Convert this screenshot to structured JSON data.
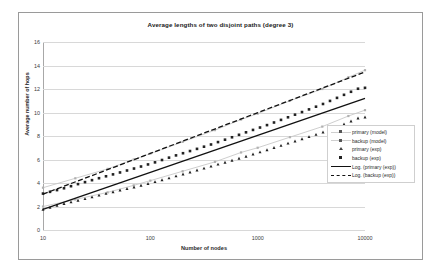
{
  "chart_data": {
    "type": "line",
    "title": "Average lengths of two disjoint paths (degree 3)",
    "xlabel": "Number of nodes",
    "ylabel": "Average number of hops",
    "xscale": "log",
    "xlim": [
      10,
      10000
    ],
    "ylim": [
      0,
      16
    ],
    "ytick_labels": [
      "0",
      "2",
      "4",
      "6",
      "8",
      "10",
      "12",
      "14",
      "16"
    ],
    "yticks": [
      0,
      2,
      4,
      6,
      8,
      10,
      12,
      14,
      16
    ],
    "xtick_labels": [
      "10",
      "100",
      "1000",
      "10000"
    ],
    "xticks": [
      10,
      100,
      1000,
      10000
    ],
    "grid": "horizontal",
    "legend_position": "right-middle",
    "legend": [
      "primary (model)",
      "backup (model)",
      "primary (exp)",
      "backup (exp)",
      "Log. (primary (exp))",
      "Log. (backup (exp))"
    ],
    "series": [
      {
        "name": "primary (model)",
        "style": "light-line-with-square-markers",
        "color": "#c8c8c8",
        "x": [
          10,
          20,
          40,
          70,
          100,
          200,
          400,
          700,
          1000,
          2000,
          4000,
          7000,
          10000
        ],
        "y": [
          2.0,
          2.6,
          3.2,
          3.8,
          4.2,
          5.0,
          5.8,
          6.6,
          7.0,
          7.9,
          8.8,
          9.7,
          10.2
        ]
      },
      {
        "name": "backup (model)",
        "style": "light-line-with-square-markers",
        "color": "#c8c8c8",
        "x": [
          10,
          20,
          40,
          70,
          100,
          200,
          400,
          700,
          1000,
          2000,
          4000,
          7000,
          10000
        ],
        "y": [
          3.6,
          4.4,
          5.2,
          6.0,
          6.5,
          7.5,
          8.5,
          9.4,
          9.9,
          11.0,
          12.0,
          13.0,
          13.6
        ]
      },
      {
        "name": "primary (exp)",
        "style": "dark-markers",
        "color": "#1a1a1a",
        "x": [
          10,
          15,
          22,
          33,
          50,
          75,
          110,
          160,
          240,
          360,
          540,
          800,
          1200,
          1800,
          2700,
          4000,
          6000,
          9000
        ],
        "y": [
          1.75,
          2.2,
          2.55,
          2.95,
          3.35,
          3.7,
          4.1,
          4.5,
          4.95,
          5.4,
          5.85,
          6.3,
          6.8,
          7.3,
          7.8,
          8.3,
          8.9,
          9.6
        ]
      },
      {
        "name": "backup (exp)",
        "style": "dark-markers",
        "color": "#1a1a1a",
        "x": [
          10,
          15,
          22,
          33,
          50,
          75,
          110,
          160,
          240,
          360,
          540,
          800,
          1200,
          1800,
          2700,
          4000,
          6000,
          9000
        ],
        "y": [
          3.1,
          3.5,
          3.95,
          4.4,
          4.85,
          5.3,
          5.75,
          6.25,
          6.75,
          7.25,
          7.8,
          8.35,
          8.9,
          9.5,
          10.1,
          10.7,
          11.4,
          12.1
        ]
      },
      {
        "name": "Log. (primary (exp))",
        "style": "solid-trendline",
        "color": "#111111",
        "x": [
          10,
          10000
        ],
        "y": [
          1.75,
          11.2
        ]
      },
      {
        "name": "Log. (backup (exp))",
        "style": "dashed-trendline",
        "color": "#111111",
        "x": [
          10,
          10000
        ],
        "y": [
          3.05,
          13.45
        ]
      }
    ]
  },
  "chart": {
    "title": "Average lengths of two disjoint paths (degree 3)",
    "x_axis_title": "Number of nodes",
    "y_axis_title": "Average number of hops"
  },
  "legend": {
    "items": [
      {
        "label": "primary (model)",
        "key": "light-line-square"
      },
      {
        "label": "backup (model)",
        "key": "light-line-square"
      },
      {
        "label": "primary (exp)",
        "key": "triangle-marker"
      },
      {
        "label": "backup (exp)",
        "key": "square-marker"
      },
      {
        "label": "Log. (primary (exp))",
        "key": "solid-line"
      },
      {
        "label": "Log. (backup (exp))",
        "key": "dashed-line"
      }
    ]
  }
}
